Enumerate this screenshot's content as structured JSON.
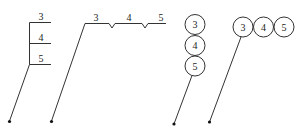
{
  "diagram": {
    "figures": [
      {
        "id": "stacked-lines",
        "style": "vertical stacked horizontal lines",
        "labels": [
          "3",
          "4",
          "5"
        ]
      },
      {
        "id": "notched-line",
        "style": "single horizontal line with notch separators",
        "labels": [
          "3",
          "4",
          "5"
        ]
      },
      {
        "id": "stacked-circles",
        "style": "vertically stacked circles",
        "labels": [
          "3",
          "4",
          "5"
        ]
      },
      {
        "id": "row-circles",
        "style": "horizontally adjacent circles",
        "labels": [
          "3",
          "4",
          "5"
        ]
      }
    ]
  }
}
